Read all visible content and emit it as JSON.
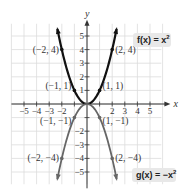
{
  "chart_data": {
    "type": "line",
    "title": "",
    "xlabel": "x",
    "ylabel": "y",
    "xlim": [
      -6,
      6
    ],
    "ylim": [
      -6,
      6
    ],
    "grid": true,
    "x_ticks": [
      -5,
      -4,
      -3,
      -2,
      2,
      3,
      4,
      5
    ],
    "x_tick_labels": [
      "−5",
      "−4",
      "−3",
      "−2",
      "2",
      "3",
      "4",
      "5"
    ],
    "y_ticks": [
      5,
      4,
      3,
      2,
      1,
      -2,
      -3,
      -4,
      -5
    ],
    "y_tick_labels": [
      "5",
      "4",
      "3",
      "2",
      "1",
      "−2",
      "−3",
      "−4",
      "−5"
    ],
    "series": [
      {
        "name": "f(x) = x²",
        "label": "f(x) = x",
        "label_sup": "2",
        "color": "#111111",
        "expression": "x^2",
        "domain": [
          -2.35,
          2.35
        ],
        "points": [
          {
            "x": -2,
            "y": 4,
            "label": "(−2, 4)"
          },
          {
            "x": -1,
            "y": 1,
            "label": "(−1, 1)"
          },
          {
            "x": 0,
            "y": 0,
            "label": ""
          },
          {
            "x": 1,
            "y": 1,
            "label": "(1, 1)"
          },
          {
            "x": 2,
            "y": 4,
            "label": "(2, 4)"
          }
        ]
      },
      {
        "name": "g(x) = −x²",
        "label": "g(x) = −x",
        "label_sup": "2",
        "color": "#666666",
        "expression": "-x^2",
        "domain": [
          -2.35,
          2.35
        ],
        "points": [
          {
            "x": -2,
            "y": -4,
            "label": "(−2, −4)"
          },
          {
            "x": -1,
            "y": -1,
            "label": "(−1, −1)"
          },
          {
            "x": 0,
            "y": 0,
            "label": ""
          },
          {
            "x": 1,
            "y": -1,
            "label": "(1, −1)"
          },
          {
            "x": 2,
            "y": -4,
            "label": "(2, −4)"
          }
        ]
      }
    ],
    "colors": {
      "grid": "#dcdcdc",
      "axis": "#333333",
      "label_box": "#e8e8e8"
    }
  }
}
